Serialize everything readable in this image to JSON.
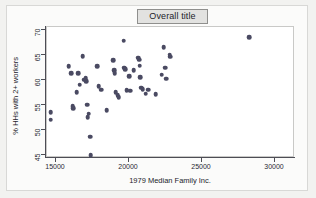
{
  "figure": {
    "title": "Overall title",
    "background_color": "#f2f2f0",
    "plot_background_color": "#ffffff",
    "marker_color": "#4a4a62",
    "axis_color": "#4d4d55",
    "title_box_color": "#e2e2e0"
  },
  "chart_data": {
    "type": "scatter",
    "title": "Overall title",
    "xlabel": "1979 Median Family Inc.",
    "ylabel": "% HHs with 2+ workers",
    "xlim": [
      13600,
      30700
    ],
    "ylim": [
      43.8,
      70.8
    ],
    "xticks": [
      15000,
      20000,
      25000,
      30000
    ],
    "yticks": [
      45,
      50,
      55,
      60,
      65,
      70
    ],
    "xticklabels": [
      "15000",
      "20000",
      "25000",
      "30000"
    ],
    "yticklabels": [
      "45",
      "50",
      "55",
      "60",
      "65",
      "70"
    ],
    "grid": false,
    "legend": false,
    "n_points": 51,
    "points": [
      {
        "x": 14700,
        "y": 53.4
      },
      {
        "x": 14700,
        "y": 51.9
      },
      {
        "x": 15950,
        "y": 62.6
      },
      {
        "x": 16100,
        "y": 61.2
      },
      {
        "x": 16200,
        "y": 54.6
      },
      {
        "x": 16250,
        "y": 54.2
      },
      {
        "x": 16500,
        "y": 57.4
      },
      {
        "x": 16600,
        "y": 61.2
      },
      {
        "x": 16700,
        "y": 58.9
      },
      {
        "x": 16900,
        "y": 64.6
      },
      {
        "x": 17000,
        "y": 59.9
      },
      {
        "x": 17100,
        "y": 60.2
      },
      {
        "x": 17150,
        "y": 59.6
      },
      {
        "x": 17200,
        "y": 54.9
      },
      {
        "x": 17250,
        "y": 52.4
      },
      {
        "x": 17300,
        "y": 53.1
      },
      {
        "x": 17400,
        "y": 48.5
      },
      {
        "x": 17450,
        "y": 44.8
      },
      {
        "x": 17900,
        "y": 62.6
      },
      {
        "x": 18000,
        "y": 58.6
      },
      {
        "x": 18150,
        "y": 57.9
      },
      {
        "x": 18550,
        "y": 53.8
      },
      {
        "x": 19000,
        "y": 63.8
      },
      {
        "x": 19050,
        "y": 61.8
      },
      {
        "x": 19100,
        "y": 61.2
      },
      {
        "x": 19150,
        "y": 57.4
      },
      {
        "x": 19300,
        "y": 56.8
      },
      {
        "x": 19350,
        "y": 56.4
      },
      {
        "x": 19700,
        "y": 67.7
      },
      {
        "x": 19750,
        "y": 62.3
      },
      {
        "x": 19800,
        "y": 62.0
      },
      {
        "x": 19900,
        "y": 57.8
      },
      {
        "x": 20100,
        "y": 60.6
      },
      {
        "x": 20150,
        "y": 57.7
      },
      {
        "x": 20400,
        "y": 61.8
      },
      {
        "x": 20700,
        "y": 64.3
      },
      {
        "x": 20750,
        "y": 63.9
      },
      {
        "x": 20800,
        "y": 62.7
      },
      {
        "x": 20850,
        "y": 60.4
      },
      {
        "x": 20900,
        "y": 58.3
      },
      {
        "x": 21000,
        "y": 58.0
      },
      {
        "x": 21200,
        "y": 57.1
      },
      {
        "x": 21400,
        "y": 57.9
      },
      {
        "x": 21900,
        "y": 57.0
      },
      {
        "x": 22300,
        "y": 60.9
      },
      {
        "x": 22450,
        "y": 66.4
      },
      {
        "x": 22550,
        "y": 62.3
      },
      {
        "x": 22600,
        "y": 60.1
      },
      {
        "x": 22850,
        "y": 64.9
      },
      {
        "x": 22900,
        "y": 64.5
      },
      {
        "x": 28300,
        "y": 68.4
      }
    ]
  }
}
